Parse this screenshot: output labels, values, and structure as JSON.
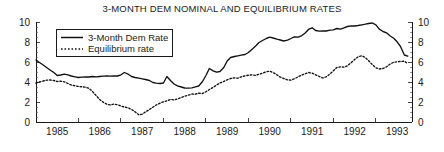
{
  "chart_data": {
    "type": "line",
    "title": "3-MONTH DEM NOMINAL AND EQUILIBRIUM RATES",
    "xlabel": "",
    "ylabel": "",
    "xlim": [
      1984.5,
      1993.35
    ],
    "ylim": [
      0,
      10
    ],
    "yticks": [
      0,
      2,
      4,
      6,
      8,
      10
    ],
    "yticks_right": [
      0,
      2,
      4,
      6,
      8,
      10
    ],
    "xticks": [
      1985,
      1986,
      1987,
      1988,
      1989,
      1990,
      1991,
      1992,
      1993
    ],
    "grid": false,
    "legend_position": "upper-left",
    "dual_y_axis": true,
    "series": [
      {
        "name": "3-Month Dem Rate",
        "style": "solid",
        "color": "#111111",
        "x": [
          1984.5,
          1984.58,
          1984.67,
          1984.75,
          1984.83,
          1984.92,
          1985.0,
          1985.08,
          1985.17,
          1985.25,
          1985.33,
          1985.42,
          1985.5,
          1985.58,
          1985.67,
          1985.75,
          1985.83,
          1985.92,
          1986.0,
          1986.08,
          1986.17,
          1986.25,
          1986.33,
          1986.42,
          1986.5,
          1986.58,
          1986.67,
          1986.75,
          1986.83,
          1986.92,
          1987.0,
          1987.08,
          1987.17,
          1987.25,
          1987.33,
          1987.42,
          1987.5,
          1987.58,
          1987.67,
          1987.75,
          1987.83,
          1987.92,
          1988.0,
          1988.08,
          1988.17,
          1988.25,
          1988.33,
          1988.42,
          1988.5,
          1988.58,
          1988.67,
          1988.75,
          1988.83,
          1988.92,
          1989.0,
          1989.08,
          1989.17,
          1989.25,
          1989.33,
          1989.42,
          1989.5,
          1989.58,
          1989.67,
          1989.75,
          1989.83,
          1989.92,
          1990.0,
          1990.08,
          1990.17,
          1990.25,
          1990.33,
          1990.42,
          1990.5,
          1990.58,
          1990.67,
          1990.75,
          1990.83,
          1990.92,
          1991.0,
          1991.08,
          1991.17,
          1991.25,
          1991.33,
          1991.42,
          1991.5,
          1991.58,
          1991.67,
          1991.75,
          1991.83,
          1991.92,
          1992.0,
          1992.08,
          1992.17,
          1992.25,
          1992.33,
          1992.42,
          1992.5,
          1992.58,
          1992.67,
          1992.75,
          1992.83,
          1992.92,
          1993.0,
          1993.08,
          1993.17,
          1993.25
        ],
        "values": [
          6.2,
          5.95,
          5.7,
          5.45,
          5.2,
          4.95,
          4.65,
          4.7,
          4.78,
          4.72,
          4.6,
          4.52,
          4.45,
          4.48,
          4.52,
          4.5,
          4.55,
          4.52,
          4.55,
          4.58,
          4.6,
          4.58,
          4.62,
          4.6,
          4.72,
          4.95,
          4.78,
          4.55,
          4.45,
          4.38,
          4.32,
          4.25,
          4.15,
          3.95,
          3.88,
          3.85,
          3.9,
          4.55,
          4.12,
          3.8,
          3.62,
          3.5,
          3.4,
          3.38,
          3.42,
          3.52,
          3.6,
          4.05,
          4.65,
          5.35,
          5.12,
          4.98,
          5.05,
          5.45,
          6.1,
          6.45,
          6.55,
          6.62,
          6.68,
          6.75,
          6.95,
          7.25,
          7.6,
          7.95,
          8.15,
          8.35,
          8.48,
          8.4,
          8.28,
          8.2,
          8.1,
          8.18,
          8.35,
          8.52,
          8.48,
          8.62,
          8.88,
          9.28,
          9.42,
          9.15,
          9.08,
          9.12,
          9.1,
          9.18,
          9.22,
          9.35,
          9.28,
          9.42,
          9.55,
          9.62,
          9.6,
          9.65,
          9.72,
          9.78,
          9.85,
          9.9,
          9.72,
          9.28,
          9.05,
          8.92,
          8.62,
          8.38,
          8.02,
          7.55,
          6.7,
          6.58
        ]
      },
      {
        "name": "Equilibrium rate",
        "style": "dotted",
        "color": "#111111",
        "x": [
          1984.5,
          1984.58,
          1984.67,
          1984.75,
          1984.83,
          1984.92,
          1985.0,
          1985.08,
          1985.17,
          1985.25,
          1985.33,
          1985.42,
          1985.5,
          1985.58,
          1985.67,
          1985.75,
          1985.83,
          1985.92,
          1986.0,
          1986.08,
          1986.17,
          1986.25,
          1986.33,
          1986.42,
          1986.5,
          1986.58,
          1986.67,
          1986.75,
          1986.83,
          1986.92,
          1987.0,
          1987.08,
          1987.17,
          1987.25,
          1987.33,
          1987.42,
          1987.5,
          1987.58,
          1987.67,
          1987.75,
          1987.83,
          1987.92,
          1988.0,
          1988.08,
          1988.17,
          1988.25,
          1988.33,
          1988.42,
          1988.5,
          1988.58,
          1988.67,
          1988.75,
          1988.83,
          1988.92,
          1989.0,
          1989.08,
          1989.17,
          1989.25,
          1989.33,
          1989.42,
          1989.5,
          1989.58,
          1989.67,
          1989.75,
          1989.83,
          1989.92,
          1990.0,
          1990.08,
          1990.17,
          1990.25,
          1990.33,
          1990.42,
          1990.5,
          1990.58,
          1990.67,
          1990.75,
          1990.83,
          1990.92,
          1991.0,
          1991.08,
          1991.17,
          1991.25,
          1991.33,
          1991.42,
          1991.5,
          1991.58,
          1991.67,
          1991.75,
          1991.83,
          1991.92,
          1992.0,
          1992.08,
          1992.17,
          1992.25,
          1992.33,
          1992.42,
          1992.5,
          1992.58,
          1992.67,
          1992.75,
          1992.83,
          1992.92,
          1993.0,
          1993.08,
          1993.17,
          1993.25
        ],
        "values": [
          3.9,
          4.0,
          4.1,
          4.18,
          4.2,
          4.15,
          4.05,
          4.08,
          4.02,
          3.85,
          3.7,
          3.62,
          3.55,
          3.52,
          3.48,
          3.35,
          3.05,
          2.62,
          2.25,
          1.98,
          1.78,
          1.7,
          1.8,
          1.72,
          1.6,
          1.5,
          1.42,
          1.25,
          1.02,
          0.72,
          0.78,
          1.02,
          1.25,
          1.48,
          1.7,
          1.88,
          2.02,
          2.12,
          2.25,
          2.2,
          2.3,
          2.45,
          2.58,
          2.68,
          2.8,
          2.78,
          2.88,
          2.85,
          3.02,
          3.25,
          3.45,
          3.7,
          3.9,
          4.05,
          4.22,
          4.35,
          4.42,
          4.38,
          4.52,
          4.62,
          4.68,
          4.72,
          4.65,
          4.78,
          4.88,
          5.02,
          5.08,
          4.95,
          4.72,
          4.48,
          4.35,
          4.22,
          4.18,
          4.32,
          4.52,
          4.68,
          4.82,
          4.95,
          4.88,
          4.72,
          4.55,
          4.4,
          4.52,
          4.8,
          5.12,
          5.45,
          5.52,
          5.48,
          5.62,
          5.95,
          6.25,
          6.52,
          6.62,
          6.45,
          6.12,
          5.72,
          5.42,
          5.3,
          5.35,
          5.52,
          5.78,
          5.98,
          6.02,
          6.05,
          6.08,
          5.85
        ]
      }
    ],
    "legend": [
      {
        "label": "3-Month Dem Rate",
        "style": "solid"
      },
      {
        "label": "Equilibrium rate",
        "style": "dotted"
      }
    ]
  }
}
